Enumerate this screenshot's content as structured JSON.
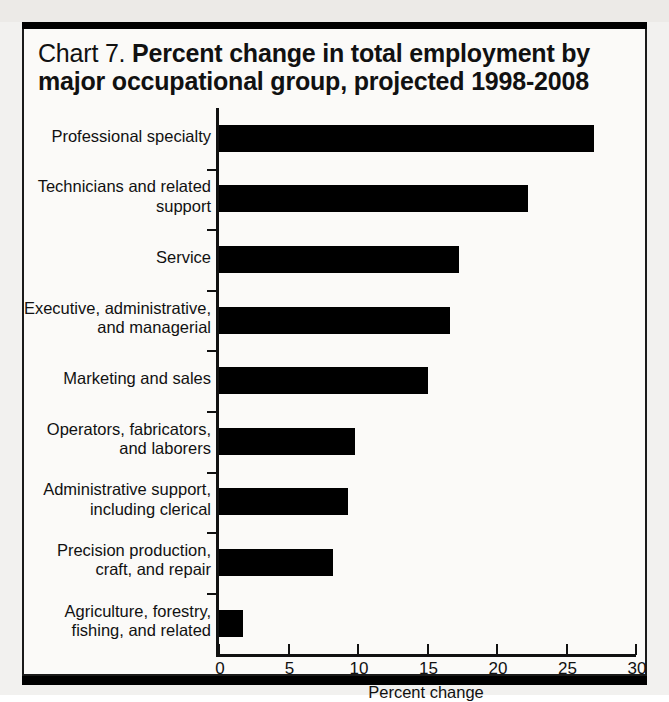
{
  "figure": {
    "chart_number_label": "Chart 7.",
    "title_main": "Percent change in total employment by major occupational group, projected 1998-2008",
    "frame_color": "#000000",
    "bar_color": "#000000",
    "background_color": "#fbfaf8"
  },
  "chart_data": {
    "type": "bar",
    "orientation": "horizontal",
    "title": "Chart 7.  Percent change in total employment by major occupational group, projected 1998-2008",
    "xlabel": "Percent change",
    "ylabel": "",
    "xlim": [
      0,
      30
    ],
    "xticks": [
      0,
      5,
      10,
      15,
      20,
      25,
      30
    ],
    "xtick_labels": [
      "0",
      "5",
      "10",
      "15",
      "20",
      "25",
      "30"
    ],
    "grid": false,
    "legend": false,
    "categories": [
      "Professional specialty",
      "Technicians and related support",
      "Service",
      "Executive, administrative, and managerial",
      "Marketing and sales",
      "Operators, fabricators, and laborers",
      "Administrative support, including clerical",
      "Precision production, craft, and repair",
      "Agriculture, forestry, fishing, and related"
    ],
    "category_label_lines": [
      [
        "Professional specialty"
      ],
      [
        "Technicians and related",
        "support"
      ],
      [
        "Service"
      ],
      [
        "Executive, administrative,",
        "and managerial"
      ],
      [
        "Marketing and sales"
      ],
      [
        "Operators, fabricators,",
        "and laborers"
      ],
      [
        "Administrative support,",
        "including clerical"
      ],
      [
        "Precision production,",
        "craft, and repair"
      ],
      [
        "Agriculture, forestry,",
        "fishing, and related"
      ]
    ],
    "values": [
      27.0,
      22.2,
      17.3,
      16.6,
      15.0,
      9.8,
      9.3,
      8.2,
      1.7
    ],
    "units": "percent"
  }
}
